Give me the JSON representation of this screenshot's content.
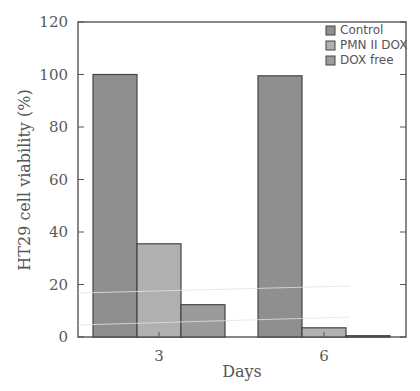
{
  "chart_data": {
    "type": "bar",
    "title": "",
    "xlabel": "Days",
    "ylabel": "HT29 cell viability (%)",
    "categories": [
      "3",
      "6"
    ],
    "series": [
      {
        "name": "Control",
        "values": [
          100,
          99.5
        ],
        "color": "#8f8f8f"
      },
      {
        "name": "PMN II DOX",
        "values": [
          35.5,
          3.5
        ],
        "color": "#b0b0b0"
      },
      {
        "name": "DOX free",
        "values": [
          12.3,
          0.5
        ],
        "color": "#9b9b9b"
      }
    ],
    "ylim": [
      0,
      120
    ],
    "yticks": [
      0,
      20,
      40,
      60,
      80,
      100,
      120
    ],
    "grid": false,
    "legend_position": "upper right"
  }
}
